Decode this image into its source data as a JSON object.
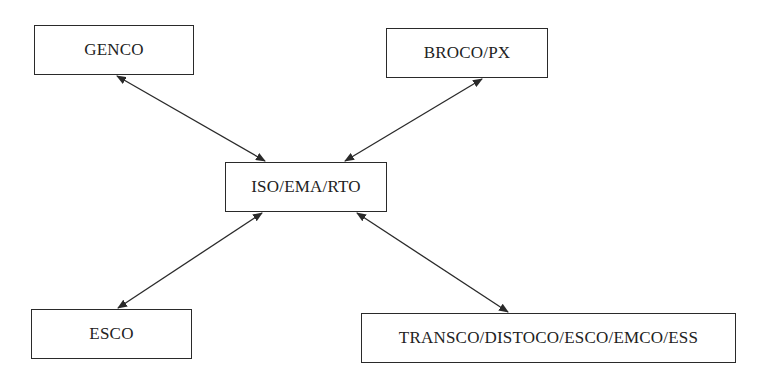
{
  "diagram": {
    "type": "hub-and-spoke",
    "nodes": [
      {
        "id": "genco",
        "label": "GENCO",
        "x": 34,
        "y": 25,
        "w": 160,
        "h": 50
      },
      {
        "id": "broco",
        "label": "BROCO/PX",
        "x": 386,
        "y": 28,
        "w": 162,
        "h": 50
      },
      {
        "id": "iso",
        "label": "ISO/EMA/RTO",
        "x": 225,
        "y": 162,
        "w": 162,
        "h": 50
      },
      {
        "id": "esco",
        "label": "ESCO",
        "x": 31,
        "y": 309,
        "w": 161,
        "h": 50
      },
      {
        "id": "transco",
        "label": "TRANSCO/DISTOCO/ESCO/EMCO/ESS",
        "x": 361,
        "y": 313,
        "w": 375,
        "h": 50
      }
    ],
    "edges": [
      {
        "from": "genco",
        "to": "iso",
        "direction": "bidirectional",
        "x1": 117,
        "y1": 76,
        "x2": 265,
        "y2": 161
      },
      {
        "from": "broco",
        "to": "iso",
        "direction": "bidirectional",
        "x1": 482,
        "y1": 79,
        "x2": 345,
        "y2": 161
      },
      {
        "from": "esco",
        "to": "iso",
        "direction": "bidirectional",
        "x1": 118,
        "y1": 308,
        "x2": 262,
        "y2": 213
      },
      {
        "from": "transco",
        "to": "iso",
        "direction": "bidirectional",
        "x1": 508,
        "y1": 312,
        "x2": 357,
        "y2": 213
      }
    ],
    "colors": {
      "stroke": "#2a2a2a",
      "text": "#222222",
      "background": "#ffffff"
    }
  }
}
